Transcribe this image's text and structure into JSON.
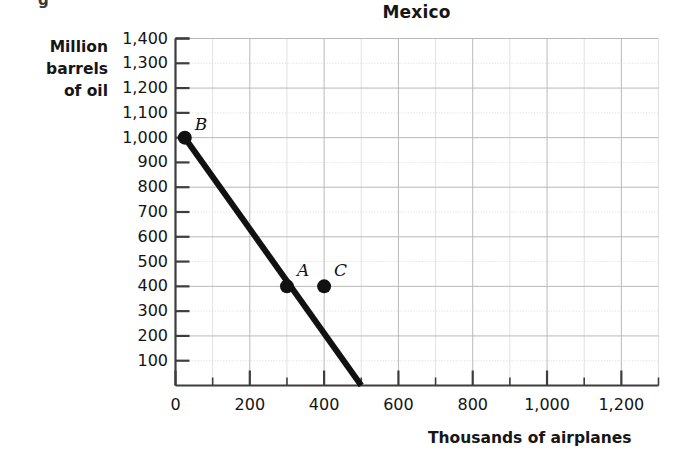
{
  "page_bleed_text": "g",
  "chart_data": {
    "type": "line",
    "title": "Mexico",
    "xlabel": "Thousands of airplanes",
    "ylabel": "Million barrels of oil",
    "ylabel_lines": [
      "Million",
      "barrels",
      "of oil"
    ],
    "xlim": [
      0,
      1300
    ],
    "ylim": [
      0,
      1400
    ],
    "x_ticks": [
      0,
      200,
      400,
      600,
      800,
      1000,
      1200
    ],
    "x_ticklabels": [
      "0",
      "200",
      "400",
      "600",
      "800",
      "1,000",
      "1,200"
    ],
    "x_minor_step": 100,
    "y_ticks": [
      100,
      200,
      300,
      400,
      500,
      600,
      700,
      800,
      900,
      1000,
      1100,
      1200,
      1300,
      1400
    ],
    "y_ticklabels": [
      "100",
      "200",
      "300",
      "400",
      "500",
      "600",
      "700",
      "800",
      "900",
      "1,000",
      "1,100",
      "1,200",
      "1,300",
      "1,400"
    ],
    "grid": true,
    "legend": null,
    "series": [
      {
        "name": "Production possibilities frontier",
        "type": "line",
        "color": "#111111",
        "x": [
          25,
          500
        ],
        "y": [
          1000,
          0
        ]
      }
    ],
    "points": [
      {
        "label": "B",
        "x": 25,
        "y": 1000,
        "on_frontier": true,
        "label_dx": 10,
        "label_dy": -8
      },
      {
        "label": "A",
        "x": 300,
        "y": 400,
        "on_frontier": true,
        "label_dx": 10,
        "label_dy": -10
      },
      {
        "label": "C",
        "x": 400,
        "y": 400,
        "on_frontier": false,
        "label_dx": 10,
        "label_dy": -10
      }
    ],
    "annotations": [],
    "colors": {
      "line": "#111111",
      "point": "#111111",
      "grid_major": "#b9b9b9",
      "grid_minor": "#d9d9d9",
      "axis": "#3d3d3d",
      "text": "#141414",
      "background": "#ffffff"
    }
  }
}
